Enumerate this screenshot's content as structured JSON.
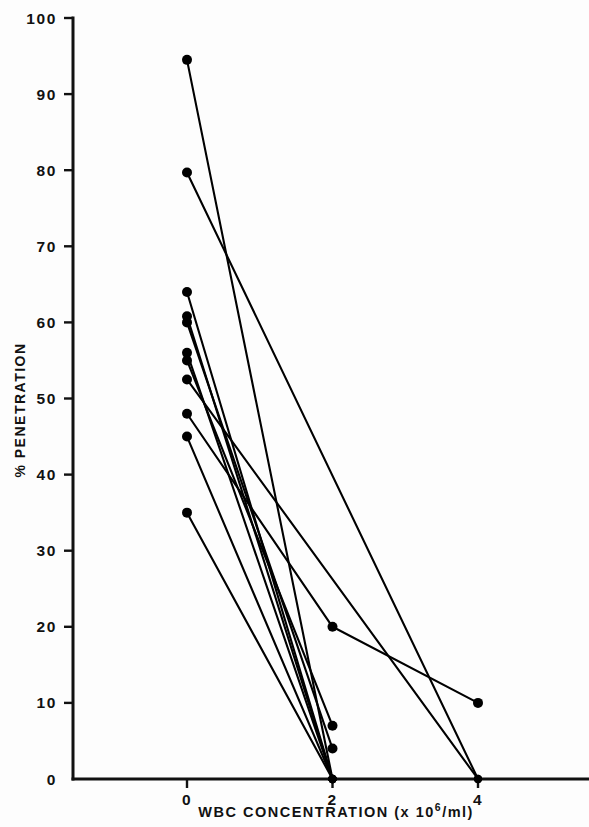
{
  "chart_data": {
    "type": "line",
    "title": "",
    "subtitle": "",
    "xlabel": "WBC CONCENTRATION (x 10^6/ml)",
    "xlabel_prefix": "WBC CONCENTRATION (x 10",
    "xlabel_exponent": "6",
    "xlabel_suffix": "/ml)",
    "ylabel": "% PENETRATION",
    "xlim": [
      -0.55,
      5.2
    ],
    "ylim": [
      0,
      100
    ],
    "xticks": [
      0,
      2,
      4
    ],
    "xtick_labels": [
      "0",
      "2",
      "4"
    ],
    "yticks": [
      0,
      10,
      20,
      30,
      40,
      50,
      60,
      70,
      80,
      90,
      100
    ],
    "ytick_labels": [
      "0",
      "10",
      "20",
      "30",
      "40",
      "50",
      "60",
      "70",
      "80",
      "90",
      "100"
    ],
    "grid": false,
    "legend": "none",
    "marker": "filled-circle",
    "marker_color": "#000000",
    "line_color": "#000000",
    "series": [
      {
        "name": "subject-1",
        "x": [
          0,
          2
        ],
        "values": [
          94.5,
          0
        ]
      },
      {
        "name": "subject-2",
        "x": [
          0,
          4
        ],
        "values": [
          79.7,
          0
        ]
      },
      {
        "name": "subject-3",
        "x": [
          0,
          2
        ],
        "values": [
          64.0,
          0
        ]
      },
      {
        "name": "subject-4",
        "x": [
          0,
          2
        ],
        "values": [
          60.8,
          0
        ]
      },
      {
        "name": "subject-5",
        "x": [
          0,
          2
        ],
        "values": [
          60.0,
          4.0
        ]
      },
      {
        "name": "subject-6",
        "x": [
          0,
          2
        ],
        "values": [
          56.0,
          0
        ]
      },
      {
        "name": "subject-7",
        "x": [
          0,
          2
        ],
        "values": [
          55.0,
          7.0
        ]
      },
      {
        "name": "subject-8",
        "x": [
          0,
          4
        ],
        "values": [
          52.5,
          0
        ]
      },
      {
        "name": "subject-9",
        "x": [
          0,
          2,
          4
        ],
        "values": [
          48.0,
          20.0,
          10.0
        ]
      },
      {
        "name": "subject-10",
        "x": [
          0,
          2
        ],
        "values": [
          45.0,
          0
        ]
      },
      {
        "name": "subject-11",
        "x": [
          0,
          2
        ],
        "values": [
          35.0,
          0
        ]
      }
    ]
  },
  "figure": {
    "background_color": "#ffffff",
    "axis_color": "#111111"
  }
}
